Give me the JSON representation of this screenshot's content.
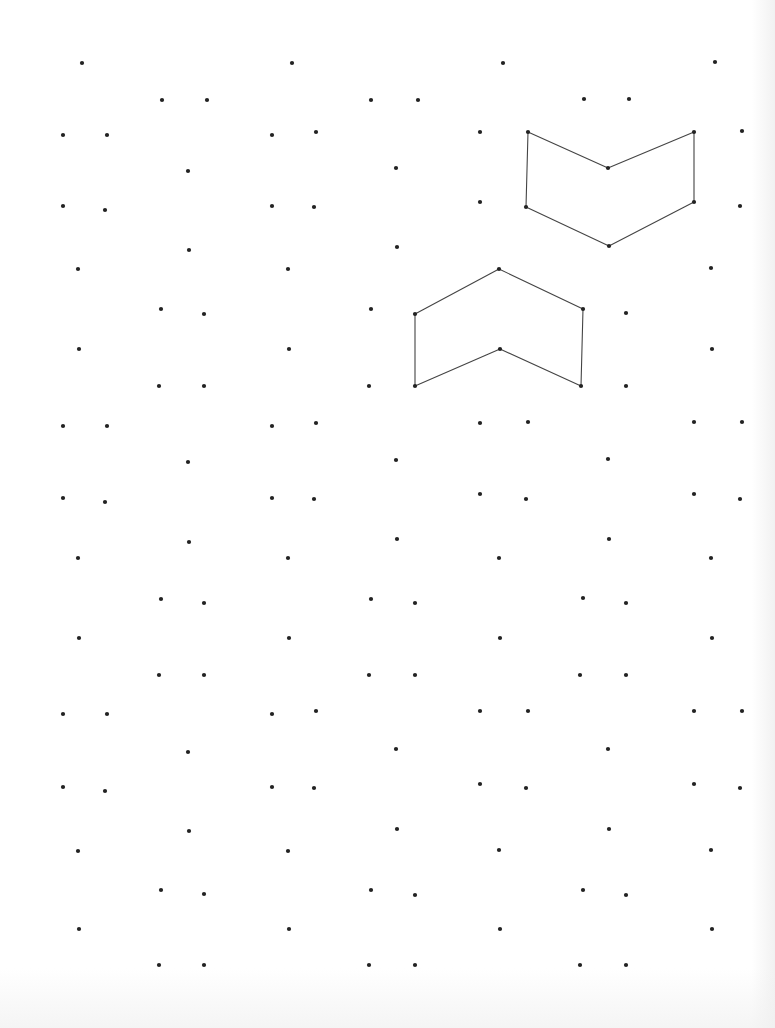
{
  "worksheet": {
    "title": "",
    "dot_color": "#222222",
    "line_color": "#444444",
    "dot_radius": 2.1,
    "line_width": 1.1
  },
  "dots": [
    [
      82,
      63
    ],
    [
      292,
      63
    ],
    [
      503,
      63
    ],
    [
      715,
      62
    ],
    [
      162,
      100
    ],
    [
      207,
      100
    ],
    [
      371,
      100
    ],
    [
      418,
      100
    ],
    [
      584,
      99
    ],
    [
      629,
      99
    ],
    [
      63,
      135
    ],
    [
      107,
      135
    ],
    [
      272,
      135
    ],
    [
      316,
      132
    ],
    [
      480,
      132
    ],
    [
      742,
      131
    ],
    [
      188,
      171
    ],
    [
      396,
      168
    ],
    [
      63,
      206
    ],
    [
      105,
      210
    ],
    [
      272,
      206
    ],
    [
      314,
      207
    ],
    [
      480,
      202
    ],
    [
      740,
      206
    ],
    [
      189,
      250
    ],
    [
      397,
      247
    ],
    [
      78,
      269
    ],
    [
      288,
      269
    ],
    [
      711,
      268
    ],
    [
      161,
      309
    ],
    [
      204,
      314
    ],
    [
      371,
      309
    ],
    [
      626,
      313
    ],
    [
      79,
      349
    ],
    [
      289,
      349
    ],
    [
      712,
      349
    ],
    [
      159,
      386
    ],
    [
      204,
      386
    ],
    [
      369,
      386
    ],
    [
      626,
      386
    ],
    [
      63,
      426
    ],
    [
      107,
      426
    ],
    [
      272,
      426
    ],
    [
      316,
      423
    ],
    [
      480,
      423
    ],
    [
      528,
      422
    ],
    [
      694,
      422
    ],
    [
      742,
      422
    ],
    [
      188,
      462
    ],
    [
      396,
      460
    ],
    [
      608,
      459
    ],
    [
      63,
      498
    ],
    [
      105,
      502
    ],
    [
      272,
      498
    ],
    [
      314,
      499
    ],
    [
      480,
      494
    ],
    [
      526,
      499
    ],
    [
      694,
      494
    ],
    [
      740,
      499
    ],
    [
      189,
      542
    ],
    [
      397,
      539
    ],
    [
      609,
      539
    ],
    [
      78,
      558
    ],
    [
      288,
      558
    ],
    [
      499,
      558
    ],
    [
      711,
      558
    ],
    [
      161,
      599
    ],
    [
      204,
      603
    ],
    [
      371,
      599
    ],
    [
      415,
      603
    ],
    [
      583,
      598
    ],
    [
      626,
      603
    ],
    [
      79,
      638
    ],
    [
      289,
      638
    ],
    [
      500,
      638
    ],
    [
      712,
      638
    ],
    [
      159,
      675
    ],
    [
      204,
      675
    ],
    [
      369,
      675
    ],
    [
      415,
      675
    ],
    [
      580,
      675
    ],
    [
      626,
      675
    ],
    [
      63,
      714
    ],
    [
      107,
      714
    ],
    [
      272,
      714
    ],
    [
      316,
      711
    ],
    [
      480,
      711
    ],
    [
      528,
      711
    ],
    [
      694,
      711
    ],
    [
      742,
      711
    ],
    [
      188,
      752
    ],
    [
      396,
      749
    ],
    [
      608,
      749
    ],
    [
      63,
      787
    ],
    [
      105,
      791
    ],
    [
      272,
      787
    ],
    [
      314,
      788
    ],
    [
      480,
      784
    ],
    [
      526,
      788
    ],
    [
      694,
      784
    ],
    [
      740,
      788
    ],
    [
      189,
      831
    ],
    [
      397,
      829
    ],
    [
      609,
      829
    ],
    [
      78,
      851
    ],
    [
      288,
      851
    ],
    [
      499,
      850
    ],
    [
      711,
      850
    ],
    [
      161,
      890
    ],
    [
      204,
      894
    ],
    [
      371,
      890
    ],
    [
      415,
      895
    ],
    [
      583,
      890
    ],
    [
      626,
      895
    ],
    [
      79,
      929
    ],
    [
      289,
      929
    ],
    [
      500,
      929
    ],
    [
      712,
      929
    ],
    [
      159,
      965
    ],
    [
      204,
      965
    ],
    [
      369,
      965
    ],
    [
      415,
      965
    ],
    [
      580,
      965
    ],
    [
      626,
      965
    ]
  ],
  "shapes": [
    {
      "name": "chevron-down-shape",
      "points": [
        [
          528,
          132
        ],
        [
          608,
          168
        ],
        [
          694,
          132
        ],
        [
          694,
          202
        ],
        [
          609,
          246
        ],
        [
          526,
          207
        ]
      ]
    },
    {
      "name": "chevron-up-shape",
      "points": [
        [
          415,
          314
        ],
        [
          499,
          269
        ],
        [
          583,
          309
        ],
        [
          581,
          386
        ],
        [
          500,
          349
        ],
        [
          415,
          386
        ]
      ]
    }
  ]
}
